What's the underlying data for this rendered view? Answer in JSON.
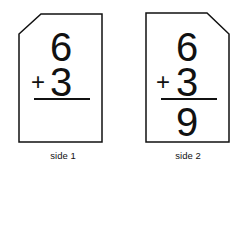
{
  "cards": [
    {
      "top": "6",
      "operator": "+",
      "bottom": "3",
      "answer": "",
      "caption": "side 1"
    },
    {
      "top": "6",
      "operator": "+",
      "bottom": "3",
      "answer": "9",
      "caption": "side 2"
    }
  ]
}
